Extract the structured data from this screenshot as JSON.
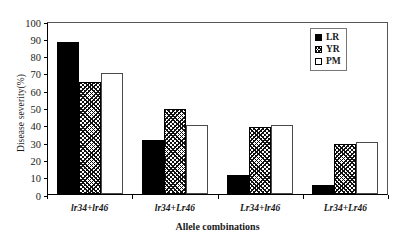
{
  "chart_data": {
    "type": "bar",
    "title": "",
    "xlabel": "Allele combinations",
    "ylabel": "Disease severity(%)",
    "categories": [
      "lr34+lr46",
      "lr34+Lr46",
      "Lr34+lr46",
      "Lr34+Lr46"
    ],
    "series": [
      {
        "name": "LR",
        "values": [
          88,
          31,
          11,
          5
        ],
        "fill": "solid-black",
        "color": "#000000"
      },
      {
        "name": "YR",
        "values": [
          65,
          49,
          39,
          29
        ],
        "fill": "cross-hatch",
        "color": "#111111"
      },
      {
        "name": "PM",
        "values": [
          70,
          40,
          40,
          30
        ],
        "fill": "open-white",
        "color": "#ffffff"
      }
    ],
    "ylim": [
      0,
      100
    ],
    "yticks": [
      0,
      10,
      20,
      30,
      40,
      50,
      60,
      70,
      80,
      90,
      100
    ],
    "ytick_labels": [
      "0",
      "10",
      "20",
      "30",
      "40",
      "50",
      "60",
      "70",
      "80",
      "90",
      "100"
    ],
    "grid": false,
    "legend_position": "top-right"
  },
  "legend": {
    "items": [
      {
        "label": "LR"
      },
      {
        "label": "YR"
      },
      {
        "label": "PM"
      }
    ]
  }
}
